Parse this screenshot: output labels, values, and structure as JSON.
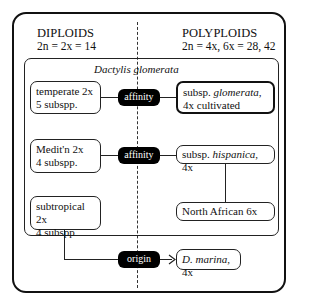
{
  "diploids": {
    "title": "DIPLOIDS",
    "formula": "2n = 2x = 14"
  },
  "polyploids": {
    "title": "POLYPLOIDS",
    "formula": "2n = 4x, 6x = 28, 42"
  },
  "species_label": "Dactylis glomerata",
  "left_boxes": [
    {
      "line1": "temperate 2x",
      "line2": "5 subspp."
    },
    {
      "line1": "Medit'n 2x",
      "line2": "4 subspp."
    },
    {
      "line1": "subtropical 2x",
      "line2": "4 subspp"
    }
  ],
  "connectors": [
    {
      "label": "affinity"
    },
    {
      "label": "affinity"
    },
    {
      "label": "origin"
    }
  ],
  "right_boxes": [
    {
      "prefix": "subsp. ",
      "italic": "glomerata",
      "suffix": ",",
      "line2": "4x cultivated"
    },
    {
      "prefix": "subsp. ",
      "italic": "hispanica",
      "suffix": ", 4x"
    },
    {
      "text": "North African 6x"
    },
    {
      "italic": "D. marina",
      "suffix": ", 4x"
    }
  ]
}
